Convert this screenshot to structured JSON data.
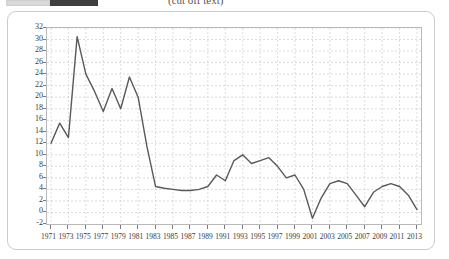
{
  "header": {
    "caption": "(cut off text)",
    "swatch_light_color": "#d9d9d9",
    "swatch_dark_color": "#3f3f3f"
  },
  "chart_card": {
    "border_color": "#c8ccd0",
    "background": "#ffffff"
  },
  "chart_data": {
    "type": "line",
    "title": "",
    "subtitle": "",
    "xlabel": "",
    "ylabel": "",
    "xlim": [
      1971,
      2013
    ],
    "ylim": [
      -2,
      32
    ],
    "ytick_step": 2,
    "xtick_step": 2,
    "grid": true,
    "grid_style": "dashed",
    "grid_color": "#cccccc",
    "legend": "none",
    "line_color": "#595959",
    "line_width": 1.4,
    "ylabels": [
      "32",
      "30",
      "28",
      "26",
      "24",
      "22",
      "20",
      "18",
      "16",
      "14",
      "12",
      "10",
      "8",
      "6",
      "4",
      "2",
      "0",
      "-2"
    ],
    "yvalues": [
      32,
      30,
      28,
      26,
      24,
      22,
      20,
      18,
      16,
      14,
      12,
      10,
      8,
      6,
      4,
      2,
      0,
      -2
    ],
    "xlabels": [
      "1971",
      "1973",
      "1975",
      "1977",
      "1979",
      "1981",
      "1983",
      "1985",
      "1987",
      "1989",
      "1991",
      "1993",
      "1995",
      "1997",
      "1999",
      "2001",
      "2003",
      "2005",
      "2007",
      "2009",
      "2011",
      "2013"
    ],
    "xtick_values": [
      1971,
      1973,
      1975,
      1977,
      1979,
      1981,
      1983,
      1985,
      1987,
      1989,
      1991,
      1993,
      1995,
      1997,
      1999,
      2001,
      2003,
      2005,
      2007,
      2009,
      2011,
      2013
    ],
    "x": [
      1971,
      1972,
      1973,
      1974,
      1975,
      1976,
      1977,
      1978,
      1979,
      1980,
      1981,
      1982,
      1983,
      1984,
      1985,
      1986,
      1987,
      1988,
      1989,
      1990,
      1991,
      1992,
      1993,
      1994,
      1995,
      1996,
      1997,
      1998,
      1999,
      2000,
      2001,
      2002,
      2003,
      2004,
      2005,
      2006,
      2007,
      2008,
      2009,
      2010,
      2011,
      2012,
      2013
    ],
    "values": [
      12.0,
      15.5,
      13.0,
      30.5,
      24.0,
      21.0,
      17.5,
      21.5,
      18.0,
      23.5,
      20.0,
      11.5,
      4.5,
      4.2,
      4.0,
      3.8,
      3.8,
      4.0,
      4.5,
      6.5,
      5.5,
      9.0,
      10.0,
      8.5,
      9.0,
      9.5,
      8.0,
      6.0,
      6.5,
      4.0,
      -1.0,
      2.5,
      5.0,
      5.5,
      5.0,
      3.0,
      1.0,
      3.5,
      4.5,
      5.0,
      4.5,
      3.0,
      0.5
    ]
  }
}
